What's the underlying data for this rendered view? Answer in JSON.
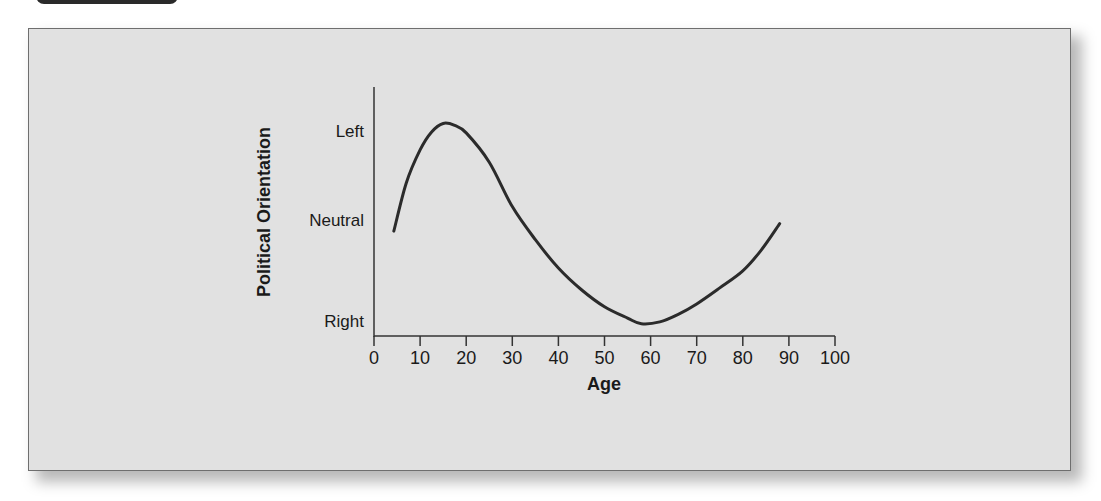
{
  "chart_data": {
    "type": "line",
    "title": "",
    "xlabel": "Age",
    "ylabel": "Political Orientation",
    "xlim": [
      0,
      100
    ],
    "x_ticks": [
      0,
      10,
      20,
      30,
      40,
      50,
      60,
      70,
      80,
      90,
      100
    ],
    "y_categories": [
      "Right",
      "Neutral",
      "Left"
    ],
    "y_category_values": {
      "Right": 0,
      "Neutral": 1,
      "Left": 2
    },
    "grid": false,
    "legend": null,
    "series": [
      {
        "name": "Political Orientation by Age",
        "x": [
          4.3,
          7,
          10,
          12.5,
          15,
          17.5,
          20,
          25,
          30,
          35,
          40,
          45,
          50,
          55,
          58,
          62,
          66,
          70,
          75,
          80,
          84,
          88
        ],
        "y": [
          0.94,
          1.45,
          1.8,
          1.99,
          2.08,
          2.06,
          1.98,
          1.67,
          1.2,
          0.85,
          0.55,
          0.32,
          0.14,
          0.02,
          -0.04,
          -0.02,
          0.06,
          0.17,
          0.34,
          0.52,
          0.74,
          1.02
        ]
      }
    ],
    "annotations": []
  },
  "axes": {
    "x_label": "Age",
    "y_label": "Political Orientation",
    "x_tick_labels": [
      "0",
      "10",
      "20",
      "30",
      "40",
      "50",
      "60",
      "70",
      "80",
      "90",
      "100"
    ],
    "y_tick_labels": [
      "Left",
      "Neutral",
      "Right"
    ]
  },
  "colors": {
    "frame_background": "#e1e1e1",
    "curve": "#2b2b2b",
    "axis": "#333333",
    "tab": "#2a2a2a"
  }
}
